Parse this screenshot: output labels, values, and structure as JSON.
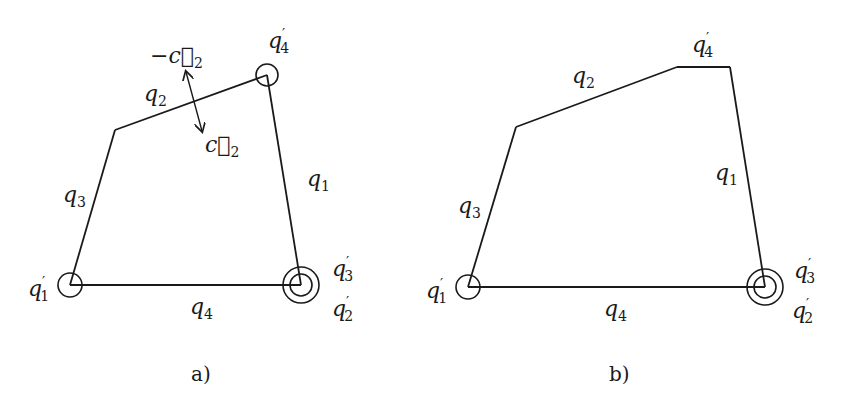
{
  "figure": {
    "panels": [
      {
        "id": "a",
        "caption": "a)",
        "edges": [
          {
            "name": "q1",
            "label": "q",
            "sub": "1"
          },
          {
            "name": "q2",
            "label": "q",
            "sub": "2"
          },
          {
            "name": "q3",
            "label": "q",
            "sub": "3"
          },
          {
            "name": "q4",
            "label": "q",
            "sub": "4"
          }
        ],
        "joints": [
          {
            "name": "q1'",
            "label": "q",
            "prime": "′",
            "sub": "1"
          },
          {
            "name": "q2'",
            "label": "q",
            "prime": "′",
            "sub": "2"
          },
          {
            "name": "q3'",
            "label": "q",
            "prime": "′",
            "sub": "3"
          },
          {
            "name": "q4'",
            "label": "q",
            "prime": "′",
            "sub": "4"
          }
        ],
        "vectors": [
          {
            "name": "neg-c2",
            "label": "−c⃗",
            "sub": "2"
          },
          {
            "name": "c2",
            "label": "c⃗",
            "sub": "2"
          }
        ]
      },
      {
        "id": "b",
        "caption": "b)",
        "edges": [
          {
            "name": "q1",
            "label": "q",
            "sub": "1"
          },
          {
            "name": "q2",
            "label": "q",
            "sub": "2"
          },
          {
            "name": "q3",
            "label": "q",
            "sub": "3"
          },
          {
            "name": "q4",
            "label": "q",
            "sub": "4"
          }
        ],
        "joints": [
          {
            "name": "q1'",
            "label": "q",
            "prime": "′",
            "sub": "1"
          },
          {
            "name": "q2'",
            "label": "q",
            "prime": "′",
            "sub": "2"
          },
          {
            "name": "q3'",
            "label": "q",
            "prime": "′",
            "sub": "3"
          },
          {
            "name": "q4'",
            "label": "q",
            "prime": "′",
            "sub": "4"
          }
        ]
      }
    ]
  }
}
